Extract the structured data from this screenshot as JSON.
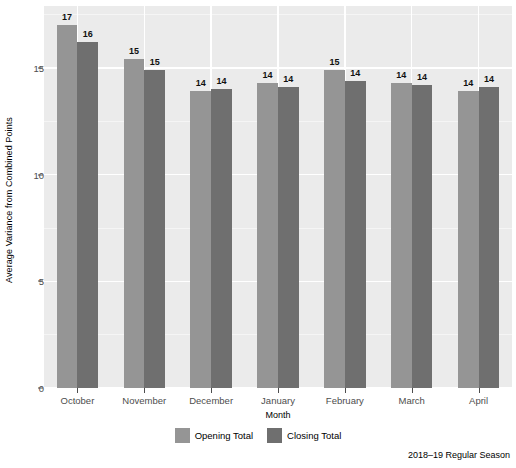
{
  "chart_data": {
    "type": "bar",
    "title": "",
    "xlabel": "Month",
    "ylabel": "Average Variance from Combined Points",
    "caption": "2018–19 Regular Season",
    "categories": [
      "October",
      "November",
      "December",
      "January",
      "February",
      "March",
      "April"
    ],
    "yticks": [
      0,
      5,
      10,
      15
    ],
    "ytick_labels": [
      "0",
      "5",
      "10",
      "15"
    ],
    "ylim": [
      0,
      17.9
    ],
    "grid": true,
    "legend_position": "bottom",
    "series": [
      {
        "name": "Opening Total",
        "color": "#959595",
        "values": [
          17.0,
          15.4,
          13.9,
          14.3,
          14.9,
          14.3,
          13.9
        ],
        "labels": [
          "17",
          "15",
          "14",
          "14",
          "15",
          "14",
          "14"
        ]
      },
      {
        "name": "Closing Total",
        "color": "#6f6f6f",
        "values": [
          16.2,
          14.9,
          14.0,
          14.1,
          14.4,
          14.2,
          14.1
        ],
        "labels": [
          "16",
          "15",
          "14",
          "14",
          "14",
          "14",
          "14"
        ]
      }
    ]
  },
  "axis": {
    "y_title": "Average Variance from Combined Points",
    "x_title": "Month"
  },
  "legend": {
    "items": [
      {
        "label": "Opening Total",
        "swatch": "opening"
      },
      {
        "label": "Closing Total",
        "swatch": "closing"
      }
    ]
  },
  "footer": {
    "caption": "2018–19 Regular Season"
  }
}
